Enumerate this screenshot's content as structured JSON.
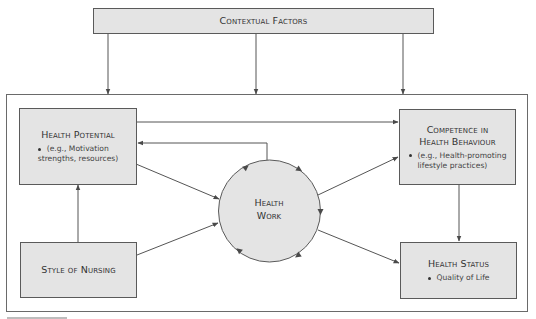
{
  "diagram": {
    "contextual_factors": {
      "title": "Contextual Factors"
    },
    "health_potential": {
      "title": "Health Potential",
      "bullet_line1": "(e.g., Motivation",
      "bullet_line2": "strengths, resources)"
    },
    "style_of_nursing": {
      "title": "Style of Nursing"
    },
    "health_work": {
      "line1": "Health",
      "line2": "Work"
    },
    "competence": {
      "title_line1": "Competence in",
      "title_line2": "Health Behaviour",
      "bullet_line1": "(e.g., Health-promoting",
      "bullet_line2": "lifestyle practices)"
    },
    "health_status": {
      "title": "Health Status",
      "bullet": "Quality of Life"
    },
    "colors": {
      "box_fill": "#e4e4e4",
      "stroke": "#5a5a5a",
      "text": "#333333"
    },
    "edges": [
      {
        "from": "Contextual Factors",
        "to": "Health Potential"
      },
      {
        "from": "Contextual Factors",
        "to": "Health Work"
      },
      {
        "from": "Contextual Factors",
        "to": "Competence in Health Behaviour"
      },
      {
        "from": "Health Potential",
        "to": "Competence in Health Behaviour"
      },
      {
        "from": "Health Work",
        "to": "Health Potential"
      },
      {
        "from": "Health Potential",
        "to": "Health Work"
      },
      {
        "from": "Style of Nursing",
        "to": "Health Potential"
      },
      {
        "from": "Style of Nursing",
        "to": "Health Work"
      },
      {
        "from": "Health Work",
        "to": "Competence in Health Behaviour"
      },
      {
        "from": "Health Work",
        "to": "Health Status"
      },
      {
        "from": "Competence in Health Behaviour",
        "to": "Health Status"
      }
    ]
  }
}
